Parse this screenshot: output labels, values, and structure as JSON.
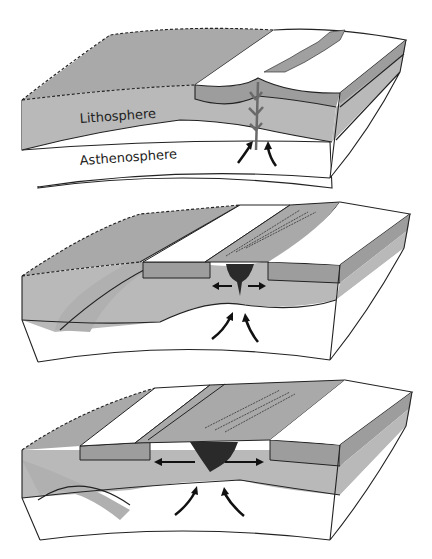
{
  "diagram": {
    "panels": [
      {
        "id": "stage-1",
        "description": "Continental crust uplifted and fractured; magma rises through lithosphere",
        "labels": {
          "lithosphere": "Lithosphere",
          "asthenosphere": "Asthenosphere"
        }
      },
      {
        "id": "stage-2",
        "description": "Rift valley forms; magma chamber spreads plates apart"
      },
      {
        "id": "stage-3",
        "description": "New oceanic crust forms at spreading ridge; plates move apart"
      }
    ],
    "colors": {
      "lithosphere": "#b9b9b9",
      "crust_dark": "#9d9d9d",
      "surface_light": "#ffffff",
      "sea_floor": "#a8a8a8",
      "magma": "#2a2a2a",
      "outline": "#222222",
      "asthenosphere": "#ffffff"
    }
  }
}
